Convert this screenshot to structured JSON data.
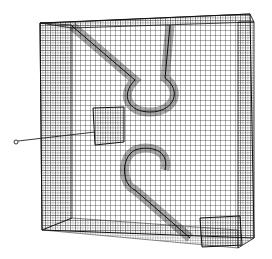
{
  "figure": {
    "colors": {
      "background": "#ffffff",
      "line": "#1a1a1a"
    }
  }
}
